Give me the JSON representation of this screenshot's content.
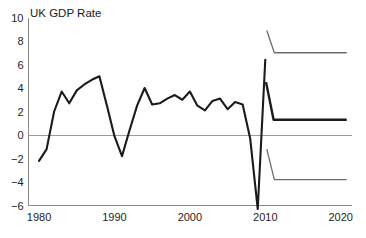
{
  "chart_data": {
    "type": "line",
    "title": "UK GDP Rate",
    "xlabel": "",
    "ylabel": "",
    "xlim": [
      1978.6,
      2021.5
    ],
    "ylim": [
      -6,
      10
    ],
    "grid": false,
    "legend": "none",
    "y_ticks": [
      10,
      8,
      6,
      4,
      2,
      0,
      -2,
      -4,
      -6
    ],
    "y_tick_labels": [
      "10",
      "8",
      "6",
      "4",
      "2",
      "0",
      "−2",
      "−4",
      "−6"
    ],
    "x_ticks": [
      1980,
      1990,
      2000,
      2010,
      2020
    ],
    "x_tick_labels": [
      "1980",
      "1990",
      "2000",
      "2010",
      "2020"
    ],
    "zero_reference_line": 0,
    "series": [
      {
        "name": "UK GDP Rate",
        "style": "solid-thick-black",
        "color": "#1b1b1b",
        "x": [
          1980,
          1981,
          1982,
          1983,
          1984,
          1985,
          1986,
          1987,
          1988,
          1989,
          1990,
          1991,
          1992,
          1993,
          1994,
          1995,
          1996,
          1997,
          1998,
          1999,
          2000,
          2001,
          2002,
          2003,
          2004,
          2005,
          2006,
          2007,
          2008,
          2009,
          2010
        ],
        "values": [
          -2.2,
          -1.2,
          2.0,
          3.7,
          2.7,
          3.8,
          4.3,
          4.7,
          5.0,
          2.5,
          -0.1,
          -1.8,
          0.4,
          2.5,
          4.0,
          2.6,
          2.7,
          3.1,
          3.4,
          3.0,
          3.7,
          2.5,
          2.1,
          2.9,
          3.1,
          2.2,
          2.8,
          2.6,
          -0.3,
          -6.3,
          6.4
        ]
      },
      {
        "name": "forecast upper bound",
        "style": "solid-thin-grey",
        "color": "#6d6d6d",
        "x": [
          2010.2,
          2011.2,
          2020.8
        ],
        "values": [
          8.9,
          7.0,
          7.0
        ]
      },
      {
        "name": "forecast central projection",
        "style": "solid-thick-black",
        "color": "#1b1b1b",
        "x": [
          2010.1,
          2011.1,
          2020.8
        ],
        "values": [
          4.5,
          1.3,
          1.3
        ]
      },
      {
        "name": "forecast lower bound",
        "style": "solid-thin-grey",
        "color": "#6d6d6d",
        "x": [
          2010.2,
          2011.2,
          2020.8
        ],
        "values": [
          -1.2,
          -3.8,
          -3.8
        ]
      }
    ]
  }
}
